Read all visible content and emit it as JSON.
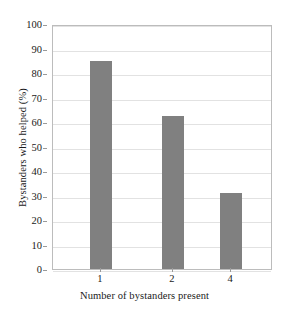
{
  "chart_data": {
    "type": "bar",
    "title": "",
    "subtitle": "",
    "categories": [
      "1",
      "2",
      "4"
    ],
    "values": [
      85,
      62.5,
      31
    ],
    "series": [
      {
        "name": "Bystanders who helped (%)",
        "values": [
          85,
          62.5,
          31
        ]
      }
    ],
    "xlabel": "Number of bystanders present",
    "ylabel": "Bystanders who helped (%)",
    "ylim": [
      0,
      100
    ],
    "yticks": [
      0,
      10,
      20,
      30,
      40,
      50,
      60,
      70,
      80,
      90,
      100
    ],
    "ytick_labels": [
      "0",
      "10",
      "20",
      "30",
      "40",
      "50",
      "60",
      "70",
      "80",
      "90",
      "100"
    ],
    "xtick_labels": [
      "1",
      "2",
      "4"
    ],
    "grid": "horizontal",
    "legend": "none",
    "bar_color": "#808080",
    "gridline_color": "#e2e2e2",
    "frame_color": "#bcbcbc",
    "background_color": "#ffffff",
    "annotations": []
  }
}
